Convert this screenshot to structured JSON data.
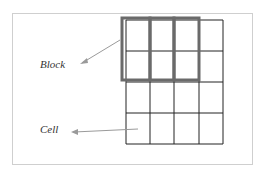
{
  "diagram": {
    "title": "",
    "labels": {
      "block": "Block",
      "cell": "Cell"
    },
    "grid": {
      "rows": 4,
      "cols": 4,
      "x": [
        126,
        150,
        174,
        199,
        223
      ],
      "y": [
        20,
        51,
        82,
        113,
        144
      ],
      "line_color": "#222222"
    },
    "blocks": [
      {
        "x": 122,
        "y": 18,
        "w": 28,
        "h": 62
      },
      {
        "x": 150,
        "y": 18,
        "w": 24,
        "h": 62
      },
      {
        "x": 174,
        "y": 18,
        "w": 25,
        "h": 62
      }
    ],
    "block_color": "#6a6a6a",
    "arrow_color": "#9a9a9a"
  }
}
